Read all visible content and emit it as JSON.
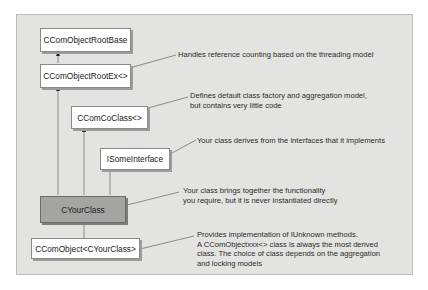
{
  "diagram": {
    "type": "class-inheritance",
    "classes": [
      {
        "id": "root_base",
        "label": "CComObjectRootBase"
      },
      {
        "id": "root_ex",
        "label": "CComObjectRootEx<>"
      },
      {
        "id": "co_class",
        "label": "CComCoClass<>"
      },
      {
        "id": "some_interface",
        "label": "ISomeInterface"
      },
      {
        "id": "your_class",
        "label": "CYourClass",
        "highlighted": true
      },
      {
        "id": "com_object",
        "label": "CComObject<CYourClass>"
      }
    ],
    "edges": [
      {
        "from": "root_ex",
        "to": "root_base"
      },
      {
        "from": "your_class",
        "to": "root_ex"
      },
      {
        "from": "your_class",
        "to": "co_class"
      },
      {
        "from": "your_class",
        "to": "some_interface"
      },
      {
        "from": "com_object",
        "to": "your_class"
      }
    ],
    "annotations": {
      "root_ex": [
        "Handles reference counting based on the threading model"
      ],
      "co_class": [
        "Defines default class factory and aggregation model,",
        "but contains very little code"
      ],
      "some_interface": [
        "Your class derives from the interfaces that it implements"
      ],
      "your_class": [
        "Your class brings together the functionality",
        "you require, but it is never instantiated directly"
      ],
      "com_object": [
        "Provides implementation of IUnknown methods.",
        "A CComObjectxxx<> class is always the most derived",
        "class. The choice of class depends on the aggregation",
        "and locking models"
      ]
    },
    "colors": {
      "panel": "#e3e3e1",
      "box": "#ffffff",
      "highlight_box": "#a4a4a2",
      "line": "#7a7a7a"
    }
  }
}
